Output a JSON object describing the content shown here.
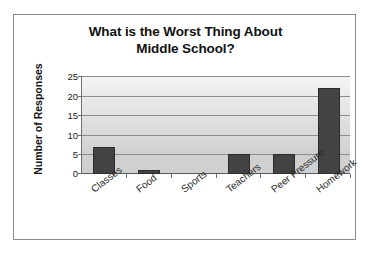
{
  "chart_data": {
    "type": "bar",
    "title": "What is the Worst Thing About Middle School?",
    "title_line1": "What is the Worst Thing About",
    "title_line2": "Middle School?",
    "xlabel": "",
    "ylabel": "Number of Responses",
    "categories": [
      "Classes",
      "Food",
      "Sports",
      "Teachers",
      "Peer Pressure",
      "Homework"
    ],
    "values": [
      7,
      1,
      0,
      5,
      5,
      22
    ],
    "ylim": [
      0,
      25
    ],
    "yticks": [
      0,
      5,
      10,
      15,
      20,
      25
    ],
    "ytick_labels": [
      "0",
      "5",
      "10",
      "15",
      "20",
      "25"
    ],
    "grid": true,
    "legend": false,
    "bar_color": "#434343",
    "plot_background": "#e2e2e2",
    "frame_color": "#8a8a8a"
  }
}
